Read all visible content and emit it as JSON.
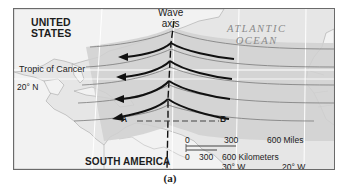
{
  "map": {
    "labels": {
      "united_states": "UNITED\nSTATES",
      "united_states_line1": "UNITED",
      "united_states_line2": "STATES",
      "atlantic_line1": "ATLANTIC",
      "atlantic_line2": "OCEAN",
      "tropic": "Tropic of Cancer",
      "lat_20n": "20° N",
      "south_america": "SOUTH AMERICA",
      "wave_line1": "Wave",
      "wave_line2": "axis",
      "point_a": "A",
      "point_b": "B",
      "lon_30w": "30° W",
      "lon_20w": "20° W"
    },
    "scale": {
      "miles": [
        "0",
        "300",
        "600 Miles"
      ],
      "km": [
        "0",
        "300",
        "600 Kilometers"
      ]
    },
    "colors": {
      "land": "#f3f3f3",
      "ocean": "#e4e4e4",
      "wave_band": "#c9c9c9",
      "arrow": "#111111",
      "streamline": "#7a7a7a"
    }
  },
  "caption": "(a)"
}
